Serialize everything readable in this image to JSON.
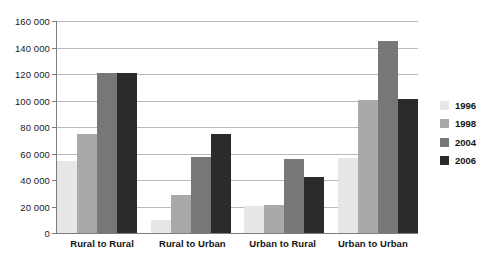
{
  "chart_data": {
    "type": "bar",
    "title": "",
    "subtitle": "",
    "xlabel": "",
    "ylabel": "",
    "categories": [
      "Rural to Rural",
      "Rural to Urban",
      "Urban to Rural",
      "Urban to Urban"
    ],
    "series": [
      {
        "name": "1996",
        "color": "#e7e7e7",
        "values": [
          54000,
          10000,
          20500,
          56500
        ]
      },
      {
        "name": "1998",
        "color": "#a9a9a9",
        "values": [
          75000,
          29000,
          20800,
          100500
        ]
      },
      {
        "name": "2004",
        "color": "#777777",
        "values": [
          120500,
          57000,
          55500,
          145000
        ]
      },
      {
        "name": "2006",
        "color": "#2b2b2b",
        "values": [
          121000,
          75000,
          42500,
          101500
        ]
      }
    ],
    "ylim": [
      0,
      160000
    ],
    "ytick_step": 20000,
    "ytick_labels": [
      "0",
      "20 000",
      "40 000",
      "60 000",
      "80 000",
      "100 000",
      "120 000",
      "140 000",
      "160 000"
    ],
    "ytick_values": [
      0,
      20000,
      40000,
      60000,
      80000,
      100000,
      120000,
      140000,
      160000
    ],
    "grid": true,
    "legend_position": "right",
    "legend_entries": [
      "1996",
      "1998",
      "2004",
      "2006"
    ],
    "gridline_color": "#b9b9b9",
    "axis_color": "#7d7d7d",
    "background_color": "#ffffff"
  }
}
